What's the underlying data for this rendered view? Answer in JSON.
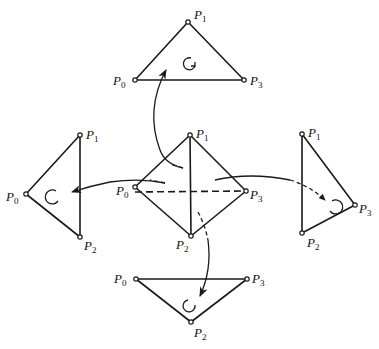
{
  "diagram": {
    "colors": {
      "stroke": "#1a1a1a",
      "background": "#ffffff"
    },
    "center_tetrahedron": {
      "labels": {
        "p0": "P",
        "p0_sub": "0",
        "p1": "P",
        "p1_sub": "1",
        "p2": "P",
        "p2_sub": "2",
        "p3": "P",
        "p3_sub": "3"
      }
    },
    "faces": [
      {
        "name": "top-face",
        "vertices": [
          "P0",
          "P1",
          "P3"
        ],
        "labels": {
          "a": "P",
          "a_sub": "1",
          "b": "P",
          "b_sub": "0",
          "c": "P",
          "c_sub": "3"
        },
        "orientation": "counterclockwise"
      },
      {
        "name": "left-face",
        "vertices": [
          "P0",
          "P1",
          "P2"
        ],
        "labels": {
          "a": "P",
          "a_sub": "1",
          "b": "P",
          "b_sub": "0",
          "c": "P",
          "c_sub": "2"
        },
        "orientation": "clockwise"
      },
      {
        "name": "right-face",
        "vertices": [
          "P1",
          "P3",
          "P2"
        ],
        "labels": {
          "a": "P",
          "a_sub": "1",
          "b": "P",
          "b_sub": "3",
          "c": "P",
          "c_sub": "2"
        },
        "orientation": "clockwise"
      },
      {
        "name": "bottom-face",
        "vertices": [
          "P0",
          "P3",
          "P2"
        ],
        "labels": {
          "a": "P",
          "a_sub": "0",
          "b": "P",
          "b_sub": "3",
          "c": "P",
          "c_sub": "2"
        },
        "orientation": "counterclockwise"
      }
    ]
  }
}
